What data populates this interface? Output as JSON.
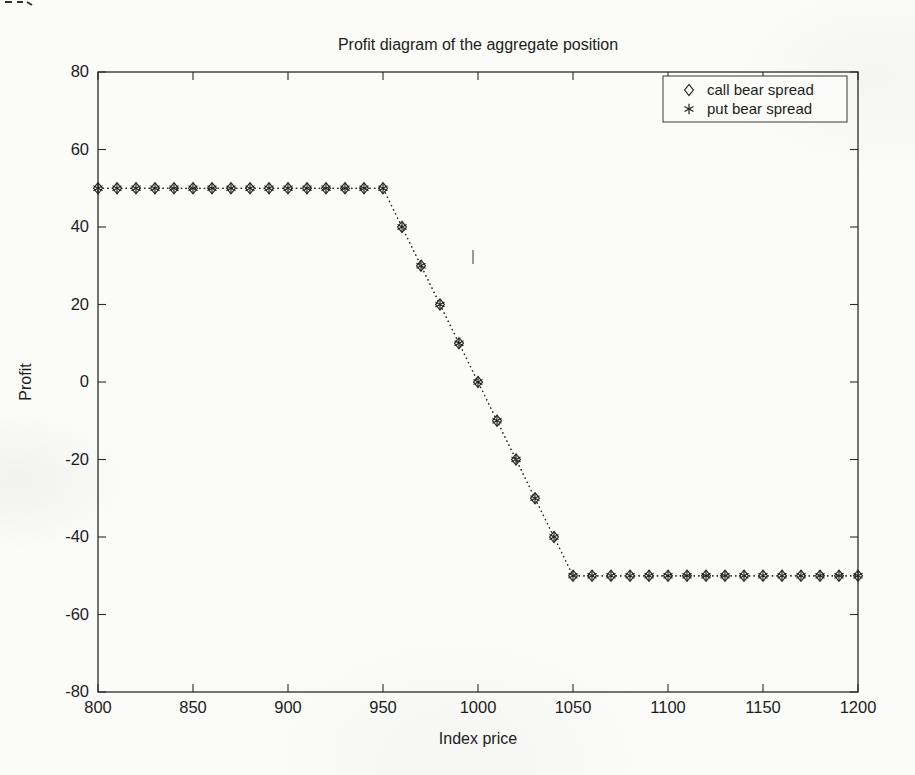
{
  "figure": {
    "background": "#fbfbf9",
    "ink_color": "#262626"
  },
  "chart_data": {
    "type": "line",
    "title": "Profit diagram of the aggregate position",
    "xlabel": "Index price",
    "ylabel": "Profit",
    "xlim": [
      800,
      1200
    ],
    "ylim": [
      -80,
      80
    ],
    "xticks": [
      800,
      850,
      900,
      950,
      1000,
      1050,
      1100,
      1150,
      1200
    ],
    "yticks": [
      -80,
      -60,
      -40,
      -20,
      0,
      20,
      40,
      60,
      80
    ],
    "grid": false,
    "legend_position": "top-right",
    "x": [
      800,
      810,
      820,
      830,
      840,
      850,
      860,
      870,
      880,
      890,
      900,
      910,
      920,
      930,
      940,
      950,
      960,
      970,
      980,
      990,
      1000,
      1010,
      1020,
      1030,
      1040,
      1050,
      1060,
      1070,
      1080,
      1090,
      1100,
      1110,
      1120,
      1130,
      1140,
      1150,
      1160,
      1170,
      1180,
      1190,
      1200
    ],
    "series": [
      {
        "name": "call bear spread",
        "marker": "diamond",
        "linestyle": "dotted",
        "values": [
          50,
          50,
          50,
          50,
          50,
          50,
          50,
          50,
          50,
          50,
          50,
          50,
          50,
          50,
          50,
          50,
          40,
          30,
          20,
          10,
          0,
          -10,
          -20,
          -30,
          -40,
          -50,
          -50,
          -50,
          -50,
          -50,
          -50,
          -50,
          -50,
          -50,
          -50,
          -50,
          -50,
          -50,
          -50,
          -50,
          -50
        ]
      },
      {
        "name": "put bear spread",
        "marker": "asterisk",
        "linestyle": "dotted",
        "values": [
          50,
          50,
          50,
          50,
          50,
          50,
          50,
          50,
          50,
          50,
          50,
          50,
          50,
          50,
          50,
          50,
          40,
          30,
          20,
          10,
          0,
          -10,
          -20,
          -30,
          -40,
          -50,
          -50,
          -50,
          -50,
          -50,
          -50,
          -50,
          -50,
          -50,
          -50,
          -50,
          -50,
          -50,
          -50,
          -50,
          -50
        ]
      }
    ]
  }
}
